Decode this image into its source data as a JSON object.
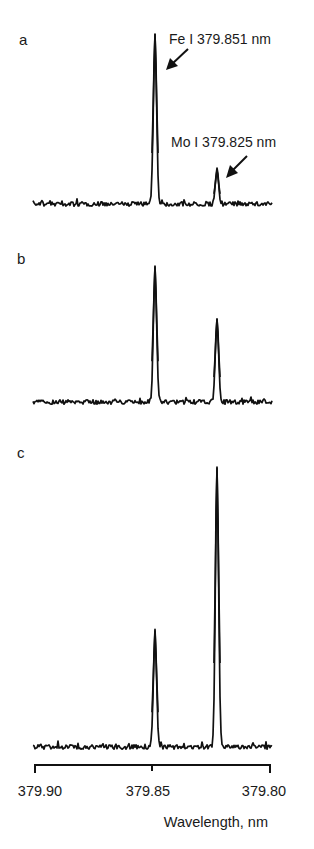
{
  "chart_data": {
    "type": "line",
    "title": "",
    "xlabel": "Wavelength, nm",
    "ylabel": "",
    "x_ticks": [
      379.9,
      379.85,
      379.8
    ],
    "x_tick_labels": [
      "379.90",
      "379.85",
      "379.80"
    ],
    "xlim": [
      379.9,
      379.8
    ],
    "x_reversed": true,
    "grid": false,
    "legend": null,
    "panels": [
      {
        "label": "a",
        "peaks": [
          {
            "element": "Fe I",
            "wavelength_nm": 379.851,
            "relative_height": 170
          },
          {
            "element": "Mo I",
            "wavelength_nm": 379.825,
            "relative_height": 34
          }
        ],
        "annotations": [
          {
            "text": "Fe I 379.851 nm",
            "points_to": "Fe I peak"
          },
          {
            "text": "Mo I 379.825 nm",
            "points_to": "Mo I peak"
          }
        ]
      },
      {
        "label": "b",
        "peaks": [
          {
            "element": "Fe I",
            "wavelength_nm": 379.851,
            "relative_height": 136
          },
          {
            "element": "Mo I",
            "wavelength_nm": 379.825,
            "relative_height": 83
          }
        ]
      },
      {
        "label": "c",
        "peaks": [
          {
            "element": "Fe I",
            "wavelength_nm": 379.851,
            "relative_height": 116
          },
          {
            "element": "Mo I",
            "wavelength_nm": 379.825,
            "relative_height": 280
          }
        ]
      }
    ]
  },
  "figure": {
    "panel_labels": [
      "a",
      "b",
      "c"
    ],
    "annotations": {
      "fe": "Fe I 379.851 nm",
      "mo": "Mo I 379.825 nm"
    },
    "axis": {
      "ticks": [
        "379.90",
        "379.85",
        "379.80"
      ],
      "title": "Wavelength, nm"
    },
    "colors": {
      "ink": "#111111",
      "background": "#ffffff"
    }
  }
}
